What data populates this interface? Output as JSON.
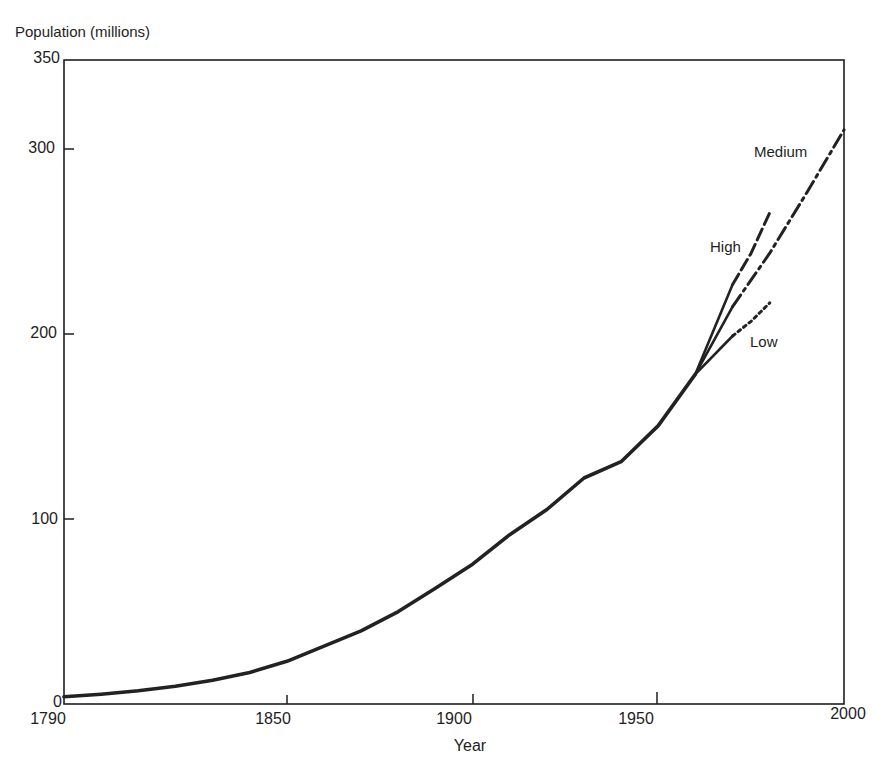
{
  "chart_data": {
    "type": "line",
    "title": "",
    "xlabel": "Year",
    "ylabel": "Population (millions)",
    "xlim": [
      1790,
      2000
    ],
    "ylim": [
      0,
      350
    ],
    "x_ticks": [
      "1790",
      "1850",
      "1900",
      "1950",
      "2000"
    ],
    "y_ticks": [
      "0",
      "100",
      "200",
      "300",
      "350"
    ],
    "grid": false,
    "legend": "inline labels",
    "series": [
      {
        "name": "Historical",
        "style": "solid",
        "x": [
          1790,
          1800,
          1810,
          1820,
          1830,
          1840,
          1850,
          1860,
          1870,
          1880,
          1890,
          1900,
          1910,
          1920,
          1930,
          1940,
          1950,
          1960
        ],
        "values": [
          3.9,
          5.3,
          7.2,
          9.6,
          12.9,
          17.1,
          23.2,
          31.4,
          39.8,
          50.2,
          62.9,
          76.0,
          92.0,
          105.7,
          122.8,
          131.7,
          151.3,
          179.3
        ]
      },
      {
        "name": "High",
        "style": "solid then dashed",
        "x": [
          1960,
          1970,
          1975,
          1980
        ],
        "values": [
          179.3,
          228,
          245,
          267
        ]
      },
      {
        "name": "Medium",
        "style": "solid then dash-dot",
        "x": [
          1960,
          1970,
          1980,
          1990,
          2000
        ],
        "values": [
          179.3,
          216,
          245,
          278,
          312
        ]
      },
      {
        "name": "Low",
        "style": "solid then dotted",
        "x": [
          1960,
          1970,
          1975,
          1980
        ],
        "values": [
          179.3,
          200,
          208,
          218
        ]
      }
    ]
  },
  "labels": {
    "ylabel": "Population (millions)",
    "xlabel": "Year",
    "high": "High",
    "medium": "Medium",
    "low": "Low",
    "y0": "0",
    "y100": "100",
    "y200": "200",
    "y300": "300",
    "y350": "350",
    "x1790": "1790",
    "x1850": "1850",
    "x1900": "1900",
    "x1950": "1950",
    "x2000": "2000"
  }
}
